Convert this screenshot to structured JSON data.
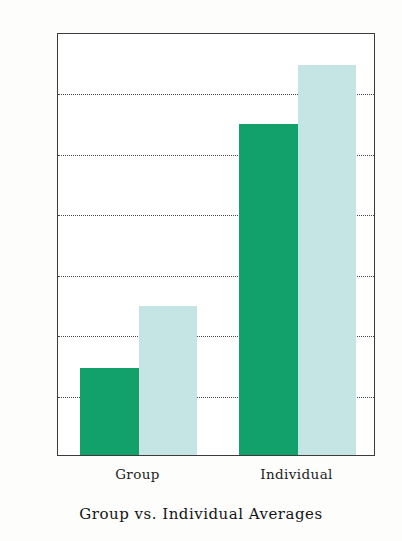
{
  "chart_data": {
    "type": "bar",
    "title": "Group vs. Individual Averages",
    "xlabel": "",
    "ylabel": "",
    "categories": [
      "Group",
      "Individual"
    ],
    "series": [
      {
        "name": "series-1",
        "color": "#12a06b",
        "values": [
          7.2,
          27.4
        ]
      },
      {
        "name": "series-2",
        "color": "#c5e4e4",
        "values": [
          12.3,
          32.3
        ]
      }
    ],
    "ylim": [
      0,
      35
    ],
    "yticks": [
      0,
      5,
      10,
      15,
      20,
      25,
      30,
      35
    ],
    "ytick_labels": [
      "0",
      "5",
      "10",
      "15",
      "20",
      "25",
      "30",
      "35"
    ],
    "grid": true,
    "grid_style": "dotted-horizontal",
    "legend": "none",
    "axis_color": "#3b3b3b",
    "background": "#ffffff"
  }
}
